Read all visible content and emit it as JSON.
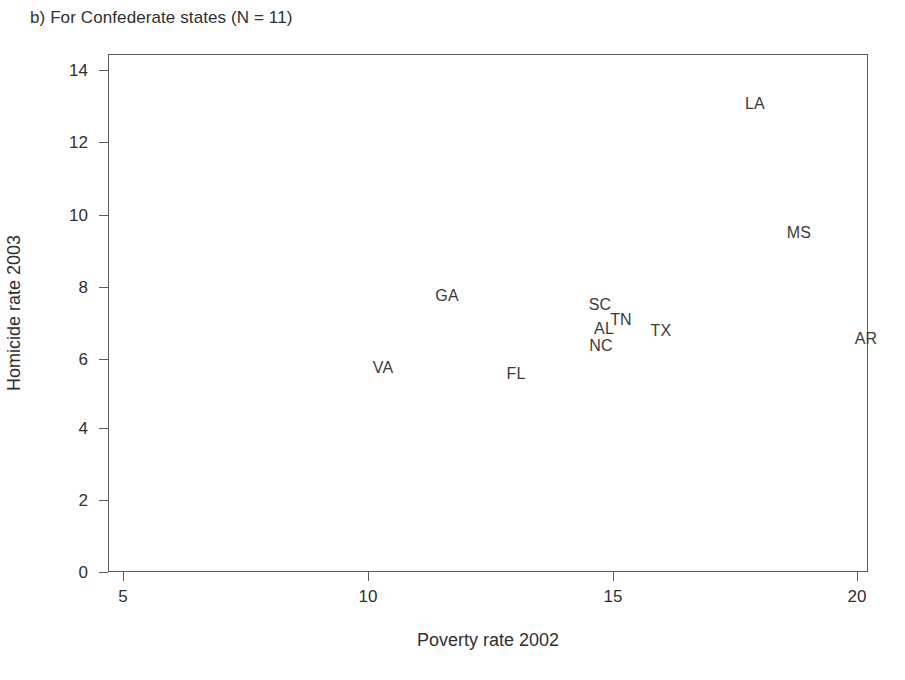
{
  "figure": {
    "panel_caption": "b) For Confederate states (N = 11)"
  },
  "chart_data": {
    "type": "scatter",
    "title": "b) For Confederate states (N = 11)",
    "xlabel": "Poverty rate 2002",
    "ylabel": "Homicide rate 2003",
    "xlim": [
      4.3,
      20.6
    ],
    "ylim": [
      0,
      14.3
    ],
    "xticks": [
      5,
      10,
      15,
      20
    ],
    "yticks": [
      0,
      2,
      4,
      6,
      8,
      10,
      12,
      14
    ],
    "xtick_labels": [
      "5",
      "10",
      "15",
      "20"
    ],
    "ytick_labels": [
      "0",
      "2",
      "4",
      "6",
      "8",
      "10",
      "12",
      "14"
    ],
    "grid": false,
    "legend": false,
    "marker_style": "text-label-only",
    "n_points": 11,
    "points": [
      {
        "label": "LA",
        "x": 17.9,
        "y": 12.9
      },
      {
        "label": "MS",
        "x": 18.8,
        "y": 9.35
      },
      {
        "label": "GA",
        "x": 11.6,
        "y": 7.6
      },
      {
        "label": "SC",
        "x": 14.7,
        "y": 7.35
      },
      {
        "label": "TN",
        "x": 15.1,
        "y": 6.95
      },
      {
        "label": "AL",
        "x": 14.8,
        "y": 6.7
      },
      {
        "label": "TX",
        "x": 16.0,
        "y": 6.65
      },
      {
        "label": "AR",
        "x": 20.2,
        "y": 6.4
      },
      {
        "label": "NC",
        "x": 14.75,
        "y": 6.25
      },
      {
        "label": "VA",
        "x": 10.3,
        "y": 5.6
      },
      {
        "label": "FL",
        "x": 13.0,
        "y": 5.45
      }
    ]
  },
  "axes": {
    "y_ticks": [
      {
        "label": "14",
        "top": 70
      },
      {
        "label": "12",
        "top": 142
      },
      {
        "label": "10",
        "top": 215
      },
      {
        "label": "8",
        "top": 287
      },
      {
        "label": "6",
        "top": 359
      },
      {
        "label": "4",
        "top": 428
      },
      {
        "label": "2",
        "top": 500
      },
      {
        "label": "0",
        "top": 572
      }
    ],
    "x_ticks": [
      {
        "label": "5",
        "left": 123
      },
      {
        "label": "10",
        "left": 368
      },
      {
        "label": "15",
        "left": 613
      },
      {
        "label": "20",
        "left": 857
      }
    ]
  },
  "labels_px": [
    {
      "name": "LA",
      "left": 755,
      "top": 104
    },
    {
      "name": "MS",
      "left": 799,
      "top": 233
    },
    {
      "name": "GA",
      "left": 447,
      "top": 296
    },
    {
      "name": "SC",
      "left": 600,
      "top": 305
    },
    {
      "name": "TN",
      "left": 621,
      "top": 320
    },
    {
      "name": "AL",
      "left": 604,
      "top": 329
    },
    {
      "name": "TX",
      "left": 661,
      "top": 331
    },
    {
      "name": "AR",
      "left": 866,
      "top": 339
    },
    {
      "name": "NC",
      "left": 601,
      "top": 346
    },
    {
      "name": "VA",
      "left": 383,
      "top": 368
    },
    {
      "name": "FL",
      "left": 516,
      "top": 374
    }
  ]
}
